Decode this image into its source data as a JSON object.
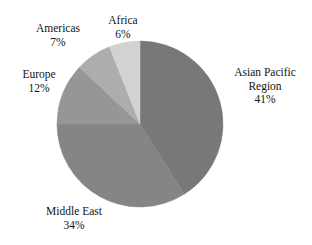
{
  "chart_data": {
    "type": "pie",
    "title": "",
    "categories": [
      "Asian Pacific Region",
      "Middle East",
      "Europe",
      "Americas",
      "Africa"
    ],
    "values": [
      41,
      34,
      12,
      7,
      6
    ],
    "value_unit": "%",
    "value_suffix": "%",
    "total": 100,
    "start_angle_deg": 0,
    "direction": "clockwise",
    "legend": "none",
    "labels_position": "outside",
    "grid": false,
    "slices": [
      {
        "name": "Asian Pacific Region",
        "name_line1": "Asian Pacific",
        "name_line2": "Region",
        "value": 41,
        "value_label": "41%",
        "color": "#787878",
        "start_deg": 0,
        "end_deg": 147.6
      },
      {
        "name": "Middle East",
        "name_line1": "Middle East",
        "name_line2": "",
        "value": 34,
        "value_label": "34%",
        "color": "#858585",
        "start_deg": 147.6,
        "end_deg": 270.0
      },
      {
        "name": "Europe",
        "name_line1": "Europe",
        "name_line2": "",
        "value": 12,
        "value_label": "12%",
        "color": "#969696",
        "start_deg": 270.0,
        "end_deg": 313.2
      },
      {
        "name": "Americas",
        "name_line1": "Americas",
        "name_line2": "",
        "value": 7,
        "value_label": "7%",
        "color": "#adadad",
        "start_deg": 313.2,
        "end_deg": 338.4
      },
      {
        "name": "Africa",
        "name_line1": "Africa",
        "name_line2": "",
        "value": 6,
        "value_label": "6%",
        "color": "#d2d2d2",
        "start_deg": 338.4,
        "end_deg": 360.0
      }
    ],
    "geometry": {
      "center_x": 140,
      "center_y": 124,
      "radius": 83
    },
    "background_color": "#ffffff",
    "text_color": "#141414"
  }
}
